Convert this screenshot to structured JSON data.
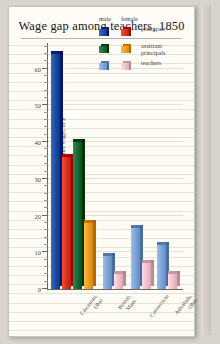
{
  "title": "Wage gap among teachers, 1850",
  "legend": {
    "male_header": "male",
    "female_header": "female",
    "rows": [
      {
        "label": "principals",
        "male_color": "#1f4fa3",
        "female_color": "#d8341f"
      },
      {
        "label": "assistant\nprincipals",
        "male_color": "#1c6b38",
        "female_color": "#efa127"
      },
      {
        "label": "teachers",
        "male_color": "#7ea6d8",
        "female_color": "#f3c3d0"
      }
    ]
  },
  "chart_data": {
    "type": "bar",
    "title": "Wage gap among teachers, 1850",
    "xlabel": "",
    "ylabel": "monthly wage, in $",
    "ylim": [
      0,
      67
    ],
    "grid": true,
    "legend_position": "top-right",
    "categories": [
      "Cincinnati, Ohio",
      "Boston, Mass.",
      "Connecticut",
      "Ashtabula, Ohio"
    ],
    "ytick_labels": [
      "0",
      "10",
      "20",
      "30",
      "40",
      "50",
      "60"
    ],
    "ytick_values": [
      0,
      10,
      20,
      30,
      40,
      50,
      60
    ],
    "series": [
      {
        "name": "male principals",
        "color": "#1f4fa3",
        "values": [
          64,
          null,
          null,
          null
        ]
      },
      {
        "name": "female principals",
        "color": "#d8341f",
        "values": [
          36,
          null,
          null,
          null
        ]
      },
      {
        "name": "male assistant principals",
        "color": "#1c6b38",
        "values": [
          40,
          null,
          null,
          null
        ]
      },
      {
        "name": "female assistant principals",
        "color": "#efa127",
        "values": [
          18,
          null,
          null,
          null
        ]
      },
      {
        "name": "male teachers",
        "color": "#7ea6d8",
        "values": [
          null,
          9,
          16.5,
          12
        ]
      },
      {
        "name": "female teachers",
        "color": "#f3c3d0",
        "values": [
          null,
          4,
          7,
          4
        ]
      }
    ]
  },
  "colors": {
    "page_background": "#d8d4cd",
    "card_background": "#fdfcf7",
    "rule_line": "#e9e2d2",
    "axis": "#6e6658",
    "text": "#4a4339",
    "title_text": "#191410"
  }
}
